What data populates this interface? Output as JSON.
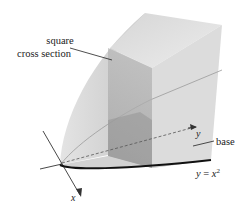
{
  "diagram": {
    "labels": {
      "cross_section_line1": "square",
      "cross_section_line2": "cross section",
      "base": "base",
      "curve_lhs": "y = ",
      "curve_var": "x",
      "curve_exp": "2",
      "axis_x": "x",
      "axis_y": "y"
    },
    "colors": {
      "solid_light": "#e6e6e6",
      "solid_mid": "#cfcfcf",
      "solid_dark": "#b3b3b3",
      "section": "#a9a9a9",
      "base_curve": "#111111",
      "axis": "#333333"
    }
  }
}
